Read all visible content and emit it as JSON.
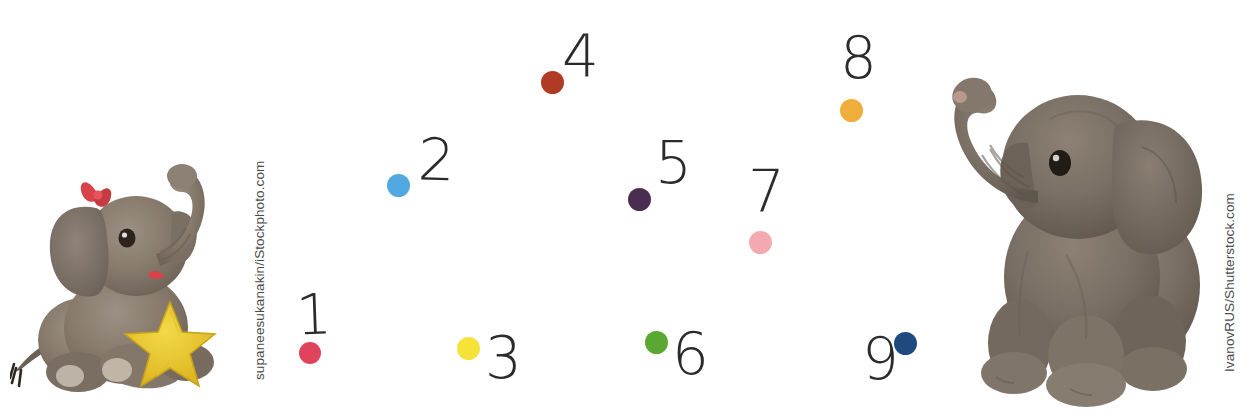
{
  "page": {
    "background_color": "#ffffff",
    "width": 1241,
    "height": 419
  },
  "photos": [
    {
      "name": "elephant-left",
      "alt": "Grey plush elephant toy sitting and holding a yellow star, red bow on head, trunk raised",
      "credit": "supaneesukanakin/iStockphoto.com",
      "body_color": "#8a7e71",
      "shadow_color": "#6e6257",
      "star_color": "#e8c12c",
      "bow_color": "#d9424a"
    },
    {
      "name": "elephant-right",
      "alt": "Grey-brown plush elephant toy sitting with trunk raised high",
      "credit": "IvanovRUS/Shutterstock.com",
      "body_color": "#7d7267",
      "shadow_color": "#635a51",
      "trunk_tip_color": "#b79a8c"
    }
  ],
  "dots": [
    {
      "label": "1",
      "color": "#e0445c",
      "color_name": "crimson-rose",
      "cx": 310,
      "cy": 353,
      "r": 11,
      "num_x": 296,
      "num_y": 287,
      "num_size": 56,
      "num_rotate": -2
    },
    {
      "label": "2",
      "color": "#52a8e0",
      "color_name": "sky-blue",
      "cx": 398,
      "cy": 185,
      "r": 11.5,
      "num_x": 418,
      "num_y": 131,
      "num_size": 58,
      "num_rotate": 2
    },
    {
      "label": "3",
      "color": "#f5e33c",
      "color_name": "yellow",
      "cx": 468,
      "cy": 348,
      "r": 11.5,
      "num_x": 485,
      "num_y": 329,
      "num_size": 58,
      "num_rotate": 0
    },
    {
      "label": "4",
      "color": "#b03a24",
      "color_name": "brick-red",
      "cx": 552,
      "cy": 82,
      "r": 11.5,
      "num_x": 562,
      "num_y": 27,
      "num_size": 58,
      "num_rotate": 0
    },
    {
      "label": "5",
      "color": "#4a2d50",
      "color_name": "dark-plum",
      "cx": 639,
      "cy": 199,
      "r": 11.5,
      "num_x": 655,
      "num_y": 134,
      "num_size": 58,
      "num_rotate": 0
    },
    {
      "label": "6",
      "color": "#5aa832",
      "color_name": "green",
      "cx": 656,
      "cy": 342,
      "r": 11.5,
      "num_x": 672,
      "num_y": 325,
      "num_size": 58,
      "num_rotate": 0
    },
    {
      "label": "7",
      "color": "#f4a8b0",
      "color_name": "light-pink",
      "cx": 760,
      "cy": 242,
      "r": 11.5,
      "num_x": 748,
      "num_y": 163,
      "num_size": 58,
      "num_rotate": 0
    },
    {
      "label": "8",
      "color": "#f0ad3c",
      "color_name": "amber-orange",
      "cx": 851,
      "cy": 110,
      "r": 11.5,
      "num_x": 840,
      "num_y": 29,
      "num_size": 58,
      "num_rotate": 0
    },
    {
      "label": "9",
      "color": "#1f4a80",
      "color_name": "navy-blue",
      "cx": 905,
      "cy": 343,
      "r": 11.5,
      "num_x": 862,
      "num_y": 330,
      "num_size": 58,
      "num_rotate": 0
    }
  ]
}
